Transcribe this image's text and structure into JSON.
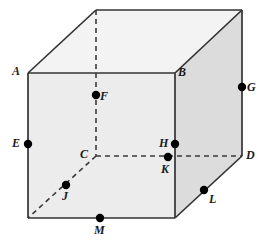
{
  "figure": {
    "type": "3d-cube-wireframe",
    "canvas": {
      "width": 270,
      "height": 244
    },
    "colors": {
      "background": "#ffffff",
      "front_face": "#ececec",
      "right_face": "#dcdcdc",
      "top_face": "#f2f2f2",
      "edge_solid": "#333333",
      "edge_hidden": "#333333",
      "marker": "#000000",
      "label_text": "#1a1a1a"
    },
    "geometry": {
      "front_top_left": {
        "x": 28,
        "y": 73
      },
      "front_top_right": {
        "x": 175,
        "y": 73
      },
      "front_bottom_right": {
        "x": 175,
        "y": 218
      },
      "front_bottom_left": {
        "x": 28,
        "y": 218
      },
      "back_top_left": {
        "x": 96,
        "y": 10
      },
      "back_top_right": {
        "x": 242,
        "y": 10
      },
      "back_bottom_right": {
        "x": 242,
        "y": 156
      },
      "back_bottom_left": {
        "x": 96,
        "y": 156
      }
    },
    "points": [
      {
        "id": "A",
        "label": "A",
        "x": 28,
        "y": 73,
        "marker": false,
        "label_x": 12,
        "label_y": 65
      },
      {
        "id": "B",
        "label": "B",
        "x": 175,
        "y": 73,
        "marker": false,
        "label_x": 178,
        "label_y": 66
      },
      {
        "id": "C",
        "label": "C",
        "x": 96,
        "y": 156,
        "marker": false,
        "label_x": 80,
        "label_y": 148
      },
      {
        "id": "D",
        "label": "D",
        "x": 242,
        "y": 156,
        "marker": false,
        "label_x": 246,
        "label_y": 149
      },
      {
        "id": "E",
        "label": "E",
        "x": 28,
        "y": 144,
        "marker": true,
        "label_x": 12,
        "label_y": 137
      },
      {
        "id": "F",
        "label": "F",
        "x": 96,
        "y": 95,
        "marker": true,
        "label_x": 100,
        "label_y": 90
      },
      {
        "id": "G",
        "label": "G",
        "x": 242,
        "y": 87,
        "marker": true,
        "label_x": 247,
        "label_y": 81
      },
      {
        "id": "H",
        "label": "H",
        "x": 175,
        "y": 144,
        "marker": true,
        "label_x": 159,
        "label_y": 137
      },
      {
        "id": "J",
        "label": "J",
        "x": 66,
        "y": 185,
        "marker": true,
        "label_x": 62,
        "label_y": 190
      },
      {
        "id": "K",
        "label": "K",
        "x": 168,
        "y": 157,
        "marker": true,
        "label_x": 161,
        "label_y": 163
      },
      {
        "id": "L",
        "label": "L",
        "x": 204,
        "y": 190,
        "marker": true,
        "label_x": 209,
        "label_y": 193
      },
      {
        "id": "M",
        "label": "M",
        "x": 100,
        "y": 218,
        "marker": true,
        "label_x": 94,
        "label_y": 224
      }
    ],
    "hidden_edges": [
      {
        "name": "back-top-left-to-C",
        "from": "back_top_left",
        "to": "back_bottom_left"
      },
      {
        "name": "C-to-D",
        "from": "back_bottom_left",
        "to": "back_bottom_right"
      },
      {
        "name": "C-to-front-bottom-left",
        "from": "back_bottom_left",
        "to": "front_bottom_left"
      }
    ]
  }
}
